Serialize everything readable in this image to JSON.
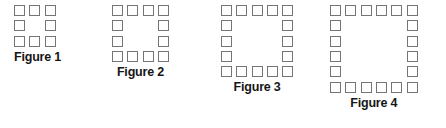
{
  "page": {
    "background_color": "#ffffff"
  },
  "style": {
    "square_border_color": "#757575",
    "square_fill_color": "#fefefe",
    "caption_color": "#161616",
    "square_size_px": 11,
    "square_pitch_px": 15.3
  },
  "figures": [
    {
      "id": "figure-1",
      "label": "Figure 1",
      "ring_size": 3,
      "square_count": 8,
      "rows": 3,
      "columns": 3
    },
    {
      "id": "figure-2",
      "label": "Figure 2",
      "ring_size": 4,
      "square_count": 12,
      "rows": 4,
      "columns": 4
    },
    {
      "id": "figure-3",
      "label": "Figure 3",
      "ring_size": 5,
      "square_count": 16,
      "rows": 5,
      "columns": 5
    },
    {
      "id": "figure-4",
      "label": "Figure 4",
      "ring_size": 6,
      "square_count": 20,
      "rows": 6,
      "columns": 6
    }
  ]
}
